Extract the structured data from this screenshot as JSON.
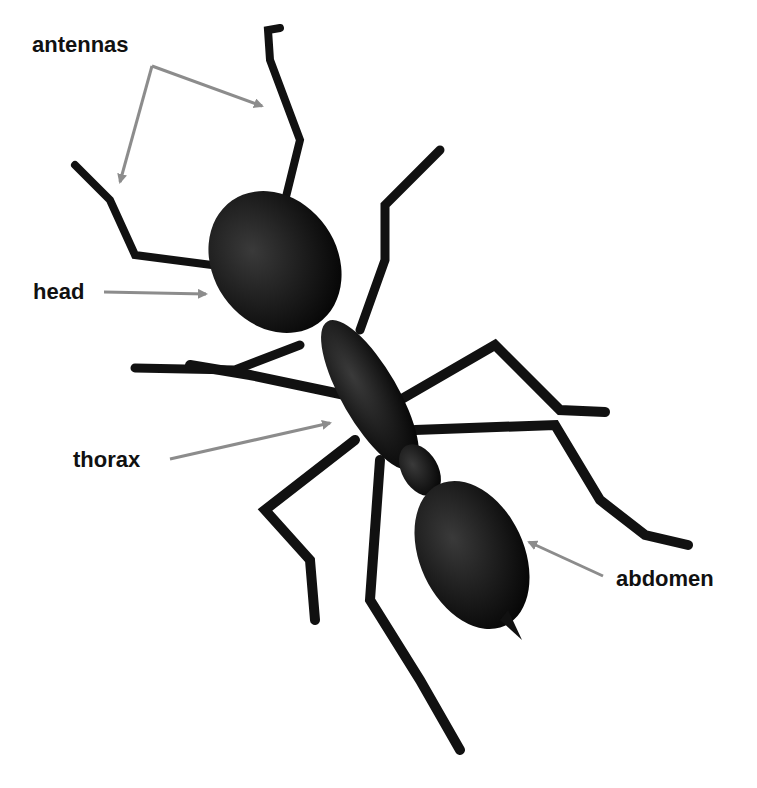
{
  "diagram": {
    "subject": "ant",
    "colors": {
      "arrow": "#8c8c8c",
      "label": "#111111",
      "body": "#0d0d0d",
      "background": "#ffffff"
    },
    "labels": [
      {
        "id": "antennas",
        "text": "antennas"
      },
      {
        "id": "head",
        "text": "head"
      },
      {
        "id": "thorax",
        "text": "thorax"
      },
      {
        "id": "abdomen",
        "text": "abdomen"
      }
    ]
  }
}
